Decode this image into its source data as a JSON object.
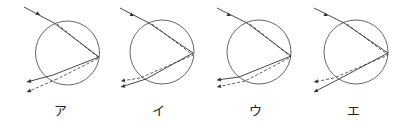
{
  "figure": {
    "colors": {
      "line": "#333333",
      "circle": "#555555",
      "background": "#ffffff"
    },
    "diagrams": [
      {
        "label": "ア",
        "circle": {
          "cx": 67.5,
          "cy": 53,
          "r": 32
        },
        "incoming": {
          "from": [
            24,
            7
          ],
          "to": [
            54,
            23
          ],
          "arrow": [
            40,
            15
          ]
        },
        "solid_inside": [
          [
            54,
            23
          ],
          [
            99,
            57
          ],
          [
            53,
            75
          ]
        ],
        "dashed_inside": [
          [
            57,
            24
          ],
          [
            99,
            58
          ],
          [
            57,
            79
          ]
        ],
        "solid_exit": {
          "from": [
            53,
            75
          ],
          "to": [
            27,
            82
          ]
        },
        "dashed_exit": {
          "from": [
            57,
            79
          ],
          "to": [
            27,
            92
          ]
        },
        "upper_exit": "solid"
      },
      {
        "label": "イ",
        "circle": {
          "cx": 162,
          "cy": 52,
          "r": 32
        },
        "incoming": {
          "from": [
            120,
            8
          ],
          "to": [
            149,
            23
          ],
          "arrow": [
            134,
            16
          ]
        },
        "solid_inside": [
          [
            149,
            23
          ],
          [
            193,
            53
          ],
          [
            146,
            79
          ]
        ],
        "dashed_inside": [
          [
            152,
            24
          ],
          [
            193,
            55
          ],
          [
            140,
            78
          ]
        ],
        "solid_exit": {
          "from": [
            146,
            79
          ],
          "to": [
            121,
            87
          ]
        },
        "dashed_exit": {
          "from": [
            140,
            78
          ],
          "to": [
            121,
            81
          ]
        },
        "upper_exit": "dashed"
      },
      {
        "label": "ウ",
        "circle": {
          "cx": 259,
          "cy": 52,
          "r": 32
        },
        "incoming": {
          "from": [
            217,
            8
          ],
          "to": [
            247,
            23
          ],
          "arrow": [
            231,
            16
          ]
        },
        "solid_inside": [
          [
            247,
            23
          ],
          [
            291,
            56
          ],
          [
            239,
            77
          ]
        ],
        "dashed_inside": [
          [
            250,
            24
          ],
          [
            291,
            57
          ],
          [
            245,
            81
          ]
        ],
        "solid_exit": {
          "from": [
            239,
            77
          ],
          "to": [
            217,
            80
          ]
        },
        "dashed_exit": {
          "from": [
            245,
            81
          ],
          "to": [
            217,
            87
          ]
        },
        "upper_exit": "solid"
      },
      {
        "label": "エ",
        "circle": {
          "cx": 356,
          "cy": 52,
          "r": 32
        },
        "incoming": {
          "from": [
            314,
            8
          ],
          "to": [
            344,
            23
          ],
          "arrow": [
            328,
            16
          ]
        },
        "solid_inside": [
          [
            344,
            23
          ],
          [
            388,
            53
          ],
          [
            339,
            79
          ]
        ],
        "dashed_inside": [
          [
            347,
            24
          ],
          [
            388,
            55
          ],
          [
            334,
            78
          ]
        ],
        "solid_exit": {
          "from": [
            339,
            79
          ],
          "to": [
            314,
            92
          ]
        },
        "dashed_exit": {
          "from": [
            334,
            78
          ],
          "to": [
            314,
            82
          ]
        },
        "upper_exit": "dashed"
      }
    ]
  },
  "labels": {
    "a": "ア",
    "i": "イ",
    "u": "ウ",
    "e": "エ"
  }
}
